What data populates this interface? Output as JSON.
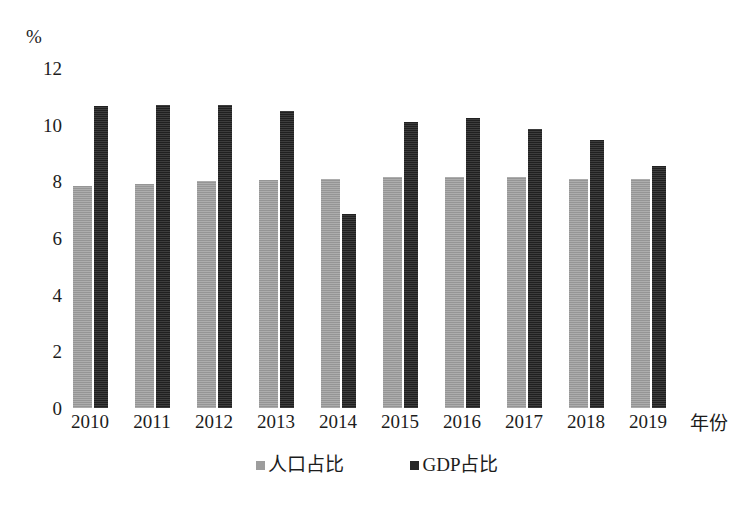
{
  "chart_data": {
    "type": "bar",
    "title": "",
    "unit_label": "%",
    "xlabel": "年份",
    "ylabel": "",
    "ylim": [
      0,
      12
    ],
    "yticks": [
      0,
      2,
      4,
      6,
      8,
      10,
      12
    ],
    "grid": false,
    "legend_position": "bottom-center",
    "categories": [
      "2010",
      "2011",
      "2012",
      "2013",
      "2014",
      "2015",
      "2016",
      "2017",
      "2018",
      "2019"
    ],
    "series": [
      {
        "name": "人口占比",
        "color": "#9d9d9d",
        "values": [
          7.85,
          7.9,
          8.0,
          8.05,
          8.1,
          8.15,
          8.15,
          8.15,
          8.1,
          8.1
        ]
      },
      {
        "name": "GDP占比",
        "color": "#272727",
        "values": [
          10.65,
          10.7,
          10.7,
          10.5,
          6.85,
          10.1,
          10.25,
          9.85,
          9.45,
          8.55
        ]
      }
    ]
  }
}
